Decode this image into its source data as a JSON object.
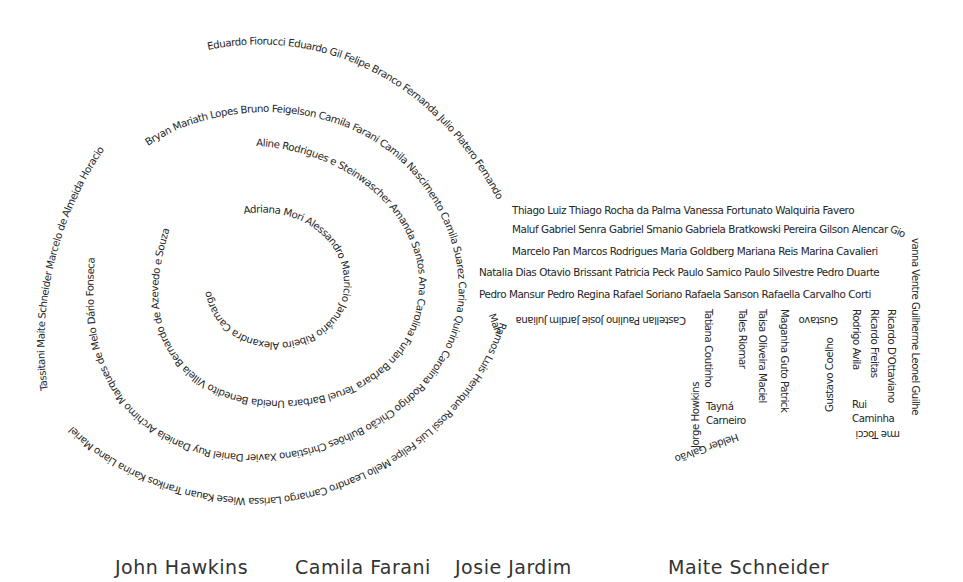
{
  "poster": {
    "spiral_arcs": {
      "outer_top": "Eduardo Fiorucci Eduardo Gil Felipe Branco Fernanda Julio Platero Fernando",
      "outer_left": "Marcelo de Almeida Horacio Maite Schneider Tassitani Luiz Felipe Arcadopo",
      "outer_left_full": "Tassitani Maite Schneider Marcelo de Almeida Horacio",
      "outer_bottom": "Ramos Luis Henrique Rossi Luis Felipe Mello Leandro Camargo Larissa Wiese Kauan Trarikos Karina Liano Mariel",
      "ring2_top": "Bryan Mariath Lopes Bruno Feigelson Camila Farani Camila Nascimento Camila Suarez Carina Quirino Carolina Rodrigo Chicão Bulhões Christiano Xavier Daniel Ruy Daniela Archimo Marques de Melo Dário Fonseca",
      "ring3": "Aline Rodrigues e Steinwascher Amanda Santos Ana Carolina Furlan Barbara Teruel Barbara Uneida Benedito Villela Bernardo de Azevedo e Souza",
      "ring4": "Adriana Mori Alessandro Mauricio Januário Ribeiro Alexandra Camargo"
    },
    "rows": [
      "Thiago Luiz  Thiago Rocha da Palma Vanessa Fortunato Walquiria Favero",
      "Maluf Gabriel Senra Gabriel Smanio Gabriela Bratkowski Pereira Gilson Alencar",
      "Marcelo Pan Marcos Rodrigues Maria Goldberg Mariana Reis Marina Cavalieri",
      "Natalia Dias Otavio Brissant Patricia Peck Paulo Samico Paulo Silvestre Pedro Duarte",
      "Pedro Mansur Pedro Regina Rafael Soriano Rafaela Sanson Rafaella Carvalho Corti"
    ],
    "upside_row": "Castellan Paulino Josie Jardim Juliana",
    "key_teeth": {
      "col_jorge": "Jorge Howkins",
      "col_tatiana": "Tatiana Coutinho",
      "tayna_1": "Tayná",
      "tayna_2": "Carneiro",
      "col_tales": "Tales Riomar",
      "col_taisa": "Taisa Oliveira Maciel",
      "col_maganha": "Maganha Guto Patrick",
      "helder": "Helder Galvão",
      "gustavo_top": "Gustavo",
      "col_gustavo_coelho": "Gustavo Coelho",
      "col_rodrigo": "Rodrigo Avila",
      "col_ricardo_f": "Ricardo Freitas",
      "col_ricardo_d": "Ricardo D'Ottaviano",
      "rui_1": "Rui",
      "rui_2": "Caminha",
      "right_edge": "Giovanna Ventre Guilherme Leonel Guilherme Tocci",
      "right_curl": "rme Tocci"
    },
    "bottom_names": [
      "John Hawkins",
      "Camila Farani",
      "Josie Jardim",
      "Maite Schneider"
    ]
  }
}
